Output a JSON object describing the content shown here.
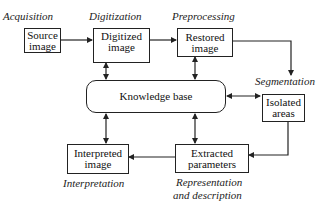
{
  "diagram": {
    "nodes": {
      "source": {
        "label_line1": "Source",
        "label_line2": "image"
      },
      "digitized": {
        "label_line1": "Digitized",
        "label_line2": "image"
      },
      "restored": {
        "label_line1": "Restored",
        "label_line2": "image"
      },
      "knowledge": {
        "label": "Knowledge base"
      },
      "isolated": {
        "label_line1": "Isolated",
        "label_line2": "areas"
      },
      "extracted": {
        "label_line1": "Extracted",
        "label_line2": "parameters"
      },
      "interpreted": {
        "label_line1": "Interpreted",
        "label_line2": "image"
      }
    },
    "stages": {
      "acquisition": "Acquisition",
      "digitization": "Digitization",
      "preprocessing": "Preprocessing",
      "segmentation": "Segmentation",
      "representation_line1": "Representation",
      "representation_line2": "and description",
      "interpretation": "Interpretation"
    },
    "edges": [
      {
        "from": "source",
        "to": "digitized",
        "type": "directed"
      },
      {
        "from": "digitized",
        "to": "restored",
        "type": "directed"
      },
      {
        "from": "restored",
        "to": "isolated",
        "type": "directed"
      },
      {
        "from": "isolated",
        "to": "extracted",
        "type": "directed"
      },
      {
        "from": "extracted",
        "to": "interpreted",
        "type": "directed"
      },
      {
        "from": "knowledge",
        "to": "digitized",
        "type": "bidirectional"
      },
      {
        "from": "knowledge",
        "to": "restored",
        "type": "bidirectional"
      },
      {
        "from": "knowledge",
        "to": "isolated",
        "type": "bidirectional"
      },
      {
        "from": "knowledge",
        "to": "extracted",
        "type": "bidirectional"
      },
      {
        "from": "knowledge",
        "to": "interpreted",
        "type": "bidirectional"
      }
    ],
    "colors": {
      "line": "#222222",
      "background": "#ffffff"
    }
  }
}
